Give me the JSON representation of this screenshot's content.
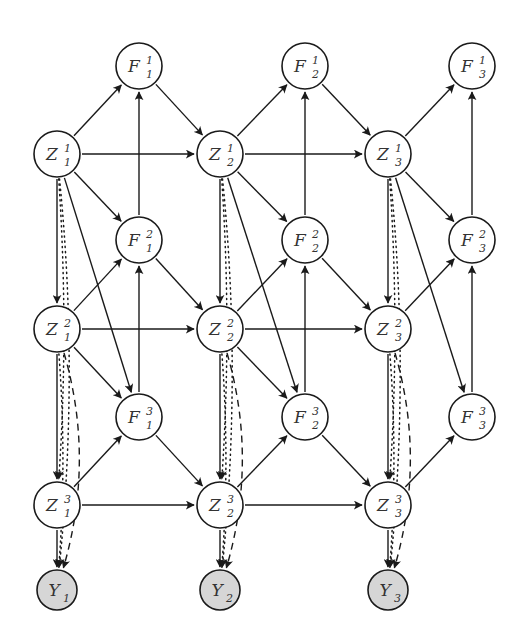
{
  "diagram": {
    "title": "",
    "colors": {
      "stroke": "#1a1a1a",
      "latent_fill": "#ffffff",
      "observed_fill": "#d6d6d6"
    },
    "nodes": [
      {
        "id": "F1_1",
        "base": "F",
        "sub": "1",
        "sup": "1",
        "x": 139,
        "y": 66,
        "r": 23,
        "observed": false
      },
      {
        "id": "F2_1",
        "base": "F",
        "sub": "2",
        "sup": "1",
        "x": 305,
        "y": 66,
        "r": 23,
        "observed": false
      },
      {
        "id": "F3_1",
        "base": "F",
        "sub": "3",
        "sup": "1",
        "x": 472,
        "y": 66,
        "r": 23,
        "observed": false
      },
      {
        "id": "Z1_1",
        "base": "Z",
        "sub": "1",
        "sup": "1",
        "x": 57,
        "y": 154,
        "r": 23,
        "observed": false
      },
      {
        "id": "Z2_1",
        "base": "Z",
        "sub": "2",
        "sup": "1",
        "x": 220,
        "y": 154,
        "r": 23,
        "observed": false
      },
      {
        "id": "Z3_1",
        "base": "Z",
        "sub": "3",
        "sup": "1",
        "x": 388,
        "y": 154,
        "r": 23,
        "observed": false
      },
      {
        "id": "F1_2",
        "base": "F",
        "sub": "1",
        "sup": "2",
        "x": 139,
        "y": 240,
        "r": 23,
        "observed": false
      },
      {
        "id": "F2_2",
        "base": "F",
        "sub": "2",
        "sup": "2",
        "x": 305,
        "y": 240,
        "r": 23,
        "observed": false
      },
      {
        "id": "F3_2",
        "base": "F",
        "sub": "3",
        "sup": "2",
        "x": 472,
        "y": 240,
        "r": 23,
        "observed": false
      },
      {
        "id": "Z1_2",
        "base": "Z",
        "sub": "1",
        "sup": "2",
        "x": 57,
        "y": 329,
        "r": 23,
        "observed": false
      },
      {
        "id": "Z2_2",
        "base": "Z",
        "sub": "2",
        "sup": "2",
        "x": 220,
        "y": 329,
        "r": 23,
        "observed": false
      },
      {
        "id": "Z3_2",
        "base": "Z",
        "sub": "3",
        "sup": "2",
        "x": 388,
        "y": 329,
        "r": 23,
        "observed": false
      },
      {
        "id": "F1_3",
        "base": "F",
        "sub": "1",
        "sup": "3",
        "x": 139,
        "y": 417,
        "r": 23,
        "observed": false
      },
      {
        "id": "F2_3",
        "base": "F",
        "sub": "2",
        "sup": "3",
        "x": 305,
        "y": 417,
        "r": 23,
        "observed": false
      },
      {
        "id": "F3_3",
        "base": "F",
        "sub": "3",
        "sup": "3",
        "x": 472,
        "y": 417,
        "r": 23,
        "observed": false
      },
      {
        "id": "Z1_3",
        "base": "Z",
        "sub": "1",
        "sup": "3",
        "x": 57,
        "y": 505,
        "r": 23,
        "observed": false
      },
      {
        "id": "Z2_3",
        "base": "Z",
        "sub": "2",
        "sup": "3",
        "x": 220,
        "y": 505,
        "r": 23,
        "observed": false
      },
      {
        "id": "Z3_3",
        "base": "Z",
        "sub": "3",
        "sup": "3",
        "x": 388,
        "y": 505,
        "r": 23,
        "observed": false
      },
      {
        "id": "Y1",
        "base": "Y",
        "sub": "1",
        "sup": "",
        "x": 57,
        "y": 590,
        "r": 20,
        "observed": true
      },
      {
        "id": "Y2",
        "base": "Y",
        "sub": "2",
        "sup": "",
        "x": 220,
        "y": 590,
        "r": 20,
        "observed": true
      },
      {
        "id": "Y3",
        "base": "Y",
        "sub": "3",
        "sup": "",
        "x": 388,
        "y": 590,
        "r": 20,
        "observed": true
      }
    ],
    "edges": [
      {
        "from": "Z1_1",
        "to": "F1_1",
        "style": "solid"
      },
      {
        "from": "F1_1",
        "to": "Z2_1",
        "style": "solid"
      },
      {
        "from": "Z1_1",
        "to": "Z2_1",
        "style": "solid"
      },
      {
        "from": "F1_2",
        "to": "F1_1",
        "style": "solid"
      },
      {
        "from": "Z1_1",
        "to": "F1_2",
        "style": "solid"
      },
      {
        "from": "F1_2",
        "to": "Z2_2",
        "style": "solid"
      },
      {
        "from": "Z1_2",
        "to": "F1_2",
        "style": "solid"
      },
      {
        "from": "Z1_1",
        "to": "Z1_2",
        "style": "solid"
      },
      {
        "from": "Z1_1",
        "to": "F1_3",
        "style": "solid"
      },
      {
        "from": "Z1_2",
        "to": "Z2_2",
        "style": "solid"
      },
      {
        "from": "Z1_2",
        "to": "F1_3",
        "style": "solid"
      },
      {
        "from": "F1_3",
        "to": "F1_2",
        "style": "solid"
      },
      {
        "from": "F1_3",
        "to": "Z2_3",
        "style": "solid"
      },
      {
        "from": "Z1_2",
        "to": "Z1_3",
        "style": "solid"
      },
      {
        "from": "Z1_3",
        "to": "F1_3",
        "style": "solid"
      },
      {
        "from": "Z1_3",
        "to": "Z2_3",
        "style": "solid"
      },
      {
        "from": "Z1_3",
        "to": "Y1",
        "style": "solid"
      },
      {
        "from": "Z1_1",
        "to": "Z1_3",
        "style": "dotted",
        "bend": 12
      },
      {
        "from": "Z1_1",
        "to": "Y1",
        "style": "dotted",
        "bend": 22
      },
      {
        "from": "Z1_2",
        "to": "Y1",
        "style": "dotted",
        "bend": 10
      },
      {
        "from": "Z1_2",
        "to": "Y1",
        "style": "dashed",
        "bend": 38
      },
      {
        "from": "Z2_1",
        "to": "F2_1",
        "style": "solid"
      },
      {
        "from": "F2_1",
        "to": "Z3_1",
        "style": "solid"
      },
      {
        "from": "Z2_1",
        "to": "Z3_1",
        "style": "solid"
      },
      {
        "from": "F2_2",
        "to": "F2_1",
        "style": "solid"
      },
      {
        "from": "Z2_1",
        "to": "F2_2",
        "style": "solid"
      },
      {
        "from": "F2_2",
        "to": "Z3_2",
        "style": "solid"
      },
      {
        "from": "Z2_2",
        "to": "F2_2",
        "style": "solid"
      },
      {
        "from": "Z2_1",
        "to": "Z2_2",
        "style": "solid"
      },
      {
        "from": "Z2_1",
        "to": "F2_3",
        "style": "solid"
      },
      {
        "from": "Z2_2",
        "to": "Z3_2",
        "style": "solid"
      },
      {
        "from": "Z2_2",
        "to": "F2_3",
        "style": "solid"
      },
      {
        "from": "F2_3",
        "to": "F2_2",
        "style": "solid"
      },
      {
        "from": "F2_3",
        "to": "Z3_3",
        "style": "solid"
      },
      {
        "from": "Z2_2",
        "to": "Z2_3",
        "style": "solid"
      },
      {
        "from": "Z2_3",
        "to": "F2_3",
        "style": "solid"
      },
      {
        "from": "Z2_3",
        "to": "Z3_3",
        "style": "solid"
      },
      {
        "from": "Z2_3",
        "to": "Y2",
        "style": "solid"
      },
      {
        "from": "Z2_1",
        "to": "Z2_3",
        "style": "dotted",
        "bend": 12
      },
      {
        "from": "Z2_1",
        "to": "Y2",
        "style": "dotted",
        "bend": 22
      },
      {
        "from": "Z2_2",
        "to": "Y2",
        "style": "dotted",
        "bend": 10
      },
      {
        "from": "Z2_2",
        "to": "Y2",
        "style": "dashed",
        "bend": 38
      },
      {
        "from": "Z3_1",
        "to": "F3_1",
        "style": "solid"
      },
      {
        "from": "F3_2",
        "to": "F3_1",
        "style": "solid"
      },
      {
        "from": "Z3_1",
        "to": "F3_2",
        "style": "solid"
      },
      {
        "from": "Z3_2",
        "to": "F3_2",
        "style": "solid"
      },
      {
        "from": "Z3_1",
        "to": "Z3_2",
        "style": "solid"
      },
      {
        "from": "Z3_1",
        "to": "F3_3",
        "style": "solid"
      },
      {
        "from": "F3_3",
        "to": "F3_2",
        "style": "solid"
      },
      {
        "from": "Z3_2",
        "to": "Z3_3",
        "style": "solid"
      },
      {
        "from": "Z3_3",
        "to": "F3_3",
        "style": "solid"
      },
      {
        "from": "Z3_3",
        "to": "Y3",
        "style": "solid"
      },
      {
        "from": "Z3_1",
        "to": "Z3_3",
        "style": "dotted",
        "bend": 12
      },
      {
        "from": "Z3_1",
        "to": "Y3",
        "style": "dotted",
        "bend": 22
      },
      {
        "from": "Z3_2",
        "to": "Y3",
        "style": "dotted",
        "bend": 10
      },
      {
        "from": "Z3_2",
        "to": "Y3",
        "style": "dashed",
        "bend": 38
      }
    ]
  }
}
